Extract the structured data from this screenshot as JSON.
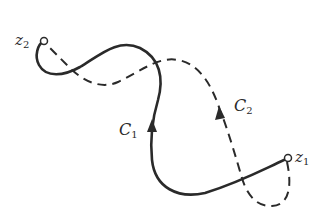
{
  "diagram": {
    "colors": {
      "stroke": "#2a2a2a",
      "background": "#ffffff"
    },
    "points": [
      {
        "id": "z1",
        "base": "z",
        "sub": "1"
      },
      {
        "id": "z2",
        "base": "z",
        "sub": "2"
      }
    ],
    "curves": [
      {
        "id": "C1",
        "base": "C",
        "sub": "1",
        "style": "solid",
        "direction": "from z1 to z2"
      },
      {
        "id": "C2",
        "base": "C",
        "sub": "2",
        "style": "dashed",
        "direction": "from z1 to z2"
      }
    ]
  }
}
